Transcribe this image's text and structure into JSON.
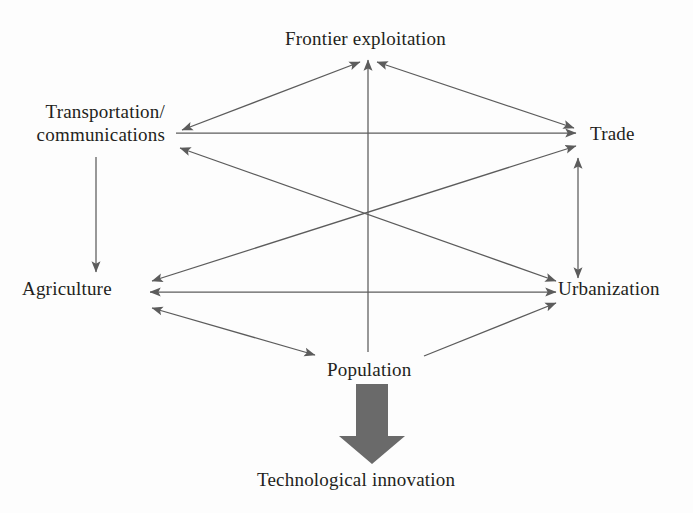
{
  "figure": {
    "title": "",
    "background_color": "#fdfdfd",
    "line_color": "#5c5c5c",
    "text_color": "#231f20",
    "block_arrow_color": "#6a6a6a"
  },
  "nodes": {
    "frontier": {
      "label": "Frontier exploitation",
      "x": 368,
      "y": 40
    },
    "transportation": {
      "label": "Transportation/\ncommunications",
      "line1": "Transportation/",
      "line2": "communications",
      "x": 93,
      "y": 128
    },
    "trade": {
      "label": "Trade",
      "x": 617,
      "y": 133
    },
    "agriculture": {
      "label": "Agriculture",
      "x": 78,
      "y": 291
    },
    "urbanization": {
      "label": "Urbanization",
      "x": 612,
      "y": 291
    },
    "population": {
      "label": "Population",
      "x": 375,
      "y": 370
    },
    "technological": {
      "label": "Technological innovation",
      "x": 367,
      "y": 482
    }
  },
  "edges": [
    {
      "name": "transportation-to-frontier",
      "from": "transportation",
      "to": "frontier",
      "arrow": "both",
      "style": "thin"
    },
    {
      "name": "frontier-to-trade",
      "from": "frontier",
      "to": "trade",
      "arrow": "both",
      "style": "thin"
    },
    {
      "name": "transportation-to-trade",
      "from": "transportation",
      "to": "trade",
      "arrow": "forward",
      "style": "thin"
    },
    {
      "name": "transportation-to-urbanization",
      "from": "transportation",
      "to": "urbanization",
      "arrow": "both",
      "style": "thin"
    },
    {
      "name": "agriculture-to-trade",
      "from": "agriculture",
      "to": "trade",
      "arrow": "both",
      "style": "thin"
    },
    {
      "name": "transportation-to-agriculture",
      "from": "transportation",
      "to": "agriculture",
      "arrow": "forward",
      "style": "thin"
    },
    {
      "name": "trade-to-urbanization",
      "from": "trade",
      "to": "urbanization",
      "arrow": "both",
      "style": "thin"
    },
    {
      "name": "agriculture-to-urbanization",
      "from": "agriculture",
      "to": "urbanization",
      "arrow": "both",
      "style": "thin"
    },
    {
      "name": "population-to-frontier",
      "from": "population",
      "to": "frontier",
      "arrow": "forward",
      "style": "thin"
    },
    {
      "name": "agriculture-to-population",
      "from": "agriculture",
      "to": "population",
      "arrow": "both",
      "style": "thin"
    },
    {
      "name": "population-to-urbanization",
      "from": "population",
      "to": "urbanization",
      "arrow": "forward",
      "style": "thin"
    },
    {
      "name": "population-to-technological",
      "from": "population",
      "to": "technological",
      "arrow": "forward",
      "style": "block"
    }
  ]
}
